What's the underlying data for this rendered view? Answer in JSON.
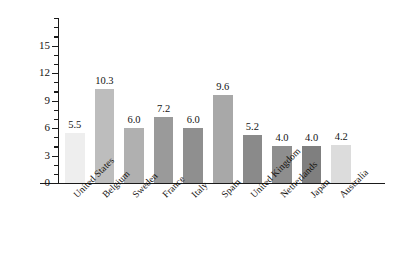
{
  "chart_data": {
    "type": "bar",
    "title": "",
    "xlabel": "",
    "ylabel": "Unemployment rate",
    "ylim": [
      0,
      18
    ],
    "ytick_labels": [
      "0",
      "3",
      "6",
      "9",
      "12",
      "15"
    ],
    "ytick_values": [
      0,
      3,
      6,
      9,
      12,
      15
    ],
    "minor_tick_interval": 1,
    "grid": false,
    "legend": null,
    "categories": [
      "United States",
      "Belgium",
      "Sweden",
      "France",
      "Italy",
      "Spain",
      "United Kingdom",
      "Netherlands",
      "Japan",
      "Australia"
    ],
    "values": [
      5.5,
      10.3,
      6.0,
      7.2,
      6.0,
      9.6,
      5.2,
      4.0,
      4.0,
      4.2
    ],
    "data_labels": [
      "5.5",
      "10.3",
      "6.0",
      "7.2",
      "6.0",
      "9.6",
      "5.2",
      "4.0",
      "4.0",
      "4.2"
    ],
    "bar_colors": [
      "#eeeeee",
      "#bdbdbd",
      "#b0b0b0",
      "#9a9a9a",
      "#8f8f8f",
      "#a8a8a8",
      "#8a8a8a",
      "#8e8e8e",
      "#7f7f7f",
      "#dcdcdc"
    ],
    "axis_color": "#1a1a1a",
    "background_color": "#ffffff",
    "text_color": "#15120f"
  }
}
